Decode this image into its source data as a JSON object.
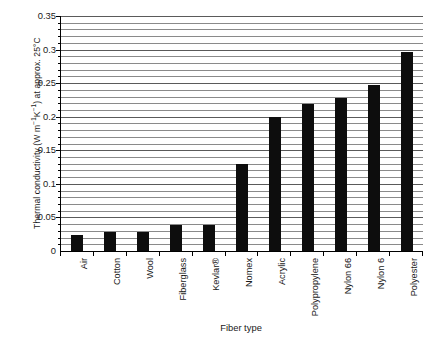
{
  "chart_data": {
    "type": "bar",
    "title": "",
    "subtitle": "",
    "xlabel": "Fiber type",
    "ylabel": "Thermal conductivity (W m⁻¹K⁻¹) at approx. 25°C",
    "ylabel_parts": {
      "prefix": "Thermal conductivity (W m",
      "sup1": "−1",
      "mid": "K",
      "sup2": "−1",
      "suffix": ") at approx. 25°C"
    },
    "categories": [
      "Air",
      "Cotton",
      "Wool",
      "Fiberglass",
      "Kevlar®",
      "Nomex",
      "Acrylic",
      "Polypropylene",
      "Nylon 66",
      "Nylon 6",
      "Polyester"
    ],
    "values": [
      0.024,
      0.029,
      0.029,
      0.039,
      0.039,
      0.13,
      0.2,
      0.219,
      0.228,
      0.247,
      0.297
    ],
    "ylim": [
      0,
      0.35
    ],
    "ytick_values": [
      0,
      0.05,
      0.1,
      0.15,
      0.2,
      0.25,
      0.3,
      0.35
    ],
    "ytick_labels": [
      "0",
      "0.05",
      "0.1",
      "0.15",
      "0.2",
      "0.25",
      "0.3",
      "0.35"
    ],
    "minor_tick_step": 0.01,
    "grid": true,
    "grid_axis": "y",
    "legend": false,
    "legend_position": "none",
    "bar_color": "#0d0d0d",
    "grid_color": "#8a8a8a",
    "axis_color": "#000000",
    "background_color": "#ffffff"
  }
}
